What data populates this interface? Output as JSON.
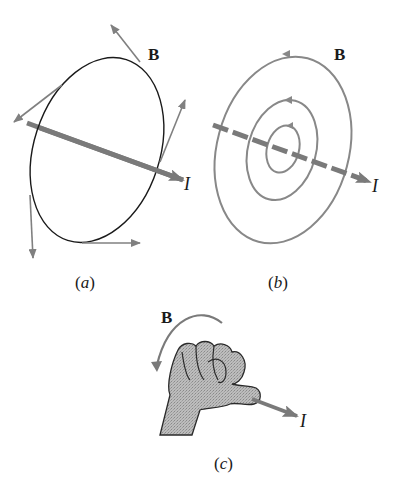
{
  "figure": {
    "panels": [
      {
        "id": "a",
        "caption": "(a)",
        "field_label": "B",
        "current_label": "I",
        "description": "Single magnetic field loop around a current-carrying wire with tangent B-field vectors"
      },
      {
        "id": "b",
        "caption": "(b)",
        "field_label": "B",
        "current_label": "I",
        "description": "Concentric circular magnetic field lines around a current-carrying wire"
      },
      {
        "id": "c",
        "caption": "(c)",
        "field_label": "B",
        "current_label": "I",
        "description": "Right-hand rule: thumb points along current, fingers curl in direction of B"
      }
    ],
    "colors": {
      "loop_line": "#1a1a1a",
      "field_gray": "#808080",
      "current_arrow": "#7a7a7a",
      "hand_fill": "#b5b5b5",
      "text": "#1a1a1a"
    }
  }
}
